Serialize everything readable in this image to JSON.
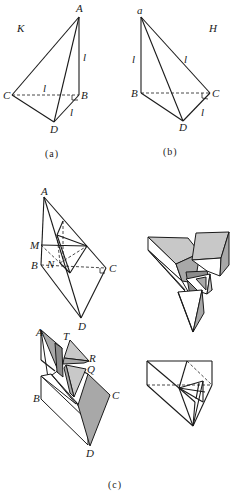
{
  "figure": {
    "panel_a": {
      "caption": "(a)",
      "space_label": "K",
      "vertices": {
        "A": "A",
        "B": "B",
        "C": "C",
        "D": "D"
      },
      "edge_labels": {
        "AB": "l",
        "CB": "l",
        "BD": "l"
      }
    },
    "panel_b": {
      "caption": "(b)",
      "space_label": "H",
      "vertices": {
        "a": "a",
        "B": "B",
        "C": "C",
        "D": "D"
      },
      "edge_labels": {
        "aB": "l",
        "aC": "l",
        "CD": "l"
      }
    },
    "panel_c": {
      "caption": "(c)",
      "top_left_vertices": {
        "A": "A",
        "M": "M",
        "B": "B",
        "N": "N",
        "C": "C",
        "D": "D"
      },
      "bottom_left_vertices": {
        "A": "A",
        "T": "T",
        "R": "R",
        "Q": "Q",
        "B": "B",
        "C": "C",
        "D": "D"
      }
    },
    "colors": {
      "line": "#1a1a1a",
      "shade_light": "#c8c8c8",
      "shade_mid": "#a8a8a8",
      "shade_dark": "#8c8c8c"
    }
  }
}
